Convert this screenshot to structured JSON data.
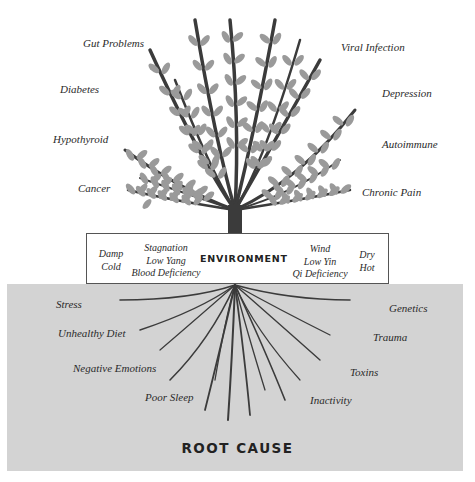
{
  "colors": {
    "ground": "#d3d3d3",
    "trunk": "#3b3b3b",
    "leaf": "#9a9a9a",
    "text": "#2a2a2a"
  },
  "symptoms": {
    "left": [
      "Gut Problems",
      "Diabetes",
      "Hypothyroid",
      "Cancer"
    ],
    "right": [
      "Viral Infection",
      "Depression",
      "Autoimmune",
      "Chronic Pain"
    ]
  },
  "environment": {
    "title": "ENVIRONMENT",
    "col1": [
      "Damp",
      "Cold"
    ],
    "col2": [
      "Stagnation",
      "Low Yang",
      "Blood Deficiency"
    ],
    "col3": [
      "Wind",
      "Low Yin",
      "Qi Deficiency"
    ],
    "col4": [
      "Dry",
      "Hot"
    ]
  },
  "causes": {
    "left": [
      "Stress",
      "Unhealthy Diet",
      "Negative Emotions",
      "Poor Sleep"
    ],
    "right": [
      "Genetics",
      "Trauma",
      "Toxins",
      "Inactivity"
    ]
  },
  "root_title": "ROOT CAUSE"
}
